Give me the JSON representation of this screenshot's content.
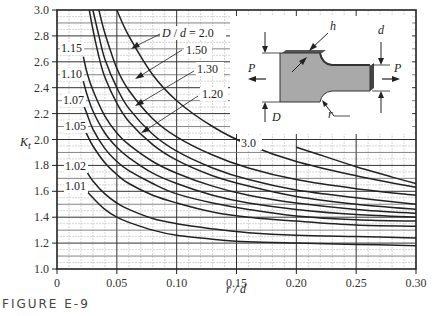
{
  "figure": {
    "caption": "FIGURE E-9"
  },
  "chart_data": {
    "type": "line",
    "title": "",
    "xlabel": "r / d",
    "ylabel": "K_t",
    "xlim": [
      0,
      0.3
    ],
    "ylim": [
      1.0,
      3.0
    ],
    "grid": true,
    "x_ticks": [
      "0",
      "0.05",
      "0.10",
      "0.15",
      "0.20",
      "0.25",
      "0.30"
    ],
    "y_ticks": [
      "1.0",
      "1.2",
      "1.4",
      "1.6",
      "1.8",
      "2.0",
      "2.2",
      "2.4",
      "2.6",
      "2.8",
      "3.0"
    ],
    "legend_title": "D / d",
    "series": [
      {
        "name": "3.0",
        "label": "3.0",
        "x": [
          0.2,
          0.22,
          0.25,
          0.28,
          0.3
        ],
        "y": [
          1.94,
          1.88,
          1.79,
          1.71,
          1.66
        ]
      },
      {
        "name": "2.0",
        "label": "D / d = 2.0",
        "x": [
          0.05,
          0.06,
          0.08,
          0.1,
          0.13,
          0.16,
          0.2,
          0.25,
          0.3
        ],
        "y": [
          3.0,
          2.8,
          2.5,
          2.3,
          2.1,
          1.96,
          1.83,
          1.72,
          1.63
        ]
      },
      {
        "name": "1.50",
        "label": "1.50",
        "x": [
          0.035,
          0.04,
          0.05,
          0.06,
          0.08,
          0.1,
          0.13,
          0.16,
          0.2,
          0.25,
          0.3
        ],
        "y": [
          3.0,
          2.82,
          2.55,
          2.38,
          2.16,
          2.02,
          1.88,
          1.78,
          1.69,
          1.62,
          1.57
        ]
      },
      {
        "name": "1.30",
        "label": "1.30",
        "x": [
          0.03,
          0.035,
          0.04,
          0.05,
          0.06,
          0.08,
          0.1,
          0.13,
          0.16,
          0.2,
          0.25,
          0.3
        ],
        "y": [
          3.0,
          2.8,
          2.62,
          2.4,
          2.24,
          2.04,
          1.91,
          1.78,
          1.69,
          1.61,
          1.55,
          1.5
        ]
      },
      {
        "name": "1.20",
        "label": "1.20",
        "x": [
          0.027,
          0.03,
          0.035,
          0.04,
          0.05,
          0.06,
          0.08,
          0.1,
          0.13,
          0.16,
          0.2,
          0.25,
          0.3
        ],
        "y": [
          3.0,
          2.85,
          2.64,
          2.48,
          2.28,
          2.14,
          1.96,
          1.84,
          1.72,
          1.64,
          1.56,
          1.5,
          1.46
        ]
      },
      {
        "name": "1.15",
        "label": "1.15",
        "x": [
          0.022,
          0.025,
          0.03,
          0.04,
          0.05,
          0.06,
          0.08,
          0.1,
          0.13,
          0.16,
          0.2,
          0.25,
          0.3
        ],
        "y": [
          2.64,
          2.52,
          2.38,
          2.18,
          2.05,
          1.96,
          1.83,
          1.74,
          1.64,
          1.57,
          1.51,
          1.46,
          1.43
        ]
      },
      {
        "name": "1.10",
        "label": "1.10",
        "x": [
          0.022,
          0.025,
          0.03,
          0.04,
          0.05,
          0.06,
          0.08,
          0.1,
          0.13,
          0.16,
          0.2,
          0.25,
          0.3
        ],
        "y": [
          2.45,
          2.35,
          2.22,
          2.05,
          1.94,
          1.86,
          1.74,
          1.66,
          1.57,
          1.51,
          1.46,
          1.42,
          1.4
        ]
      },
      {
        "name": "1.07",
        "label": "1.07",
        "x": [
          0.022,
          0.025,
          0.03,
          0.04,
          0.05,
          0.06,
          0.08,
          0.1,
          0.13,
          0.16,
          0.2,
          0.25,
          0.3
        ],
        "y": [
          2.27,
          2.2,
          2.08,
          1.93,
          1.83,
          1.76,
          1.66,
          1.58,
          1.51,
          1.46,
          1.41,
          1.38,
          1.37
        ]
      },
      {
        "name": "1.05",
        "label": "1.05",
        "x": [
          0.023,
          0.025,
          0.03,
          0.04,
          0.05,
          0.06,
          0.08,
          0.1,
          0.13,
          0.16,
          0.2,
          0.25,
          0.3
        ],
        "y": [
          2.08,
          2.04,
          1.95,
          1.82,
          1.73,
          1.66,
          1.57,
          1.51,
          1.44,
          1.4,
          1.37,
          1.34,
          1.33
        ]
      },
      {
        "name": "1.02",
        "label": "1.02",
        "x": [
          0.023,
          0.025,
          0.03,
          0.04,
          0.05,
          0.06,
          0.08,
          0.1,
          0.13,
          0.16,
          0.2,
          0.25,
          0.3
        ],
        "y": [
          1.78,
          1.75,
          1.68,
          1.58,
          1.51,
          1.46,
          1.39,
          1.35,
          1.31,
          1.28,
          1.26,
          1.25,
          1.24
        ]
      },
      {
        "name": "1.01",
        "label": "1.01",
        "x": [
          0.025,
          0.03,
          0.04,
          0.05,
          0.06,
          0.08,
          0.1,
          0.13,
          0.16,
          0.2,
          0.25,
          0.3
        ],
        "y": [
          1.6,
          1.55,
          1.46,
          1.4,
          1.36,
          1.3,
          1.26,
          1.23,
          1.21,
          1.2,
          1.19,
          1.18
        ]
      }
    ],
    "inset": {
      "description": "Stepped flat bar with shoulder fillet under axial load",
      "labels": {
        "load_left": "P",
        "load_right": "P",
        "large_width": "D",
        "small_width": "d",
        "thickness": "h",
        "fillet_radius": "r"
      }
    }
  }
}
